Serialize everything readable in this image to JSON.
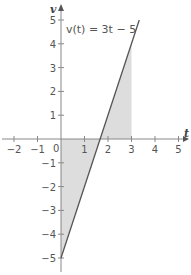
{
  "chart_data": {
    "type": "line",
    "title": "",
    "xlabel": "t",
    "ylabel": "v",
    "xlim": [
      -2.5,
      5.5
    ],
    "ylim": [
      -5.5,
      5.5
    ],
    "x_ticks": [
      -2,
      -1,
      1,
      2,
      3,
      4,
      5
    ],
    "x_tick_labels": [
      "−2",
      "−1",
      "1",
      "2",
      "3",
      "4",
      "5"
    ],
    "y_ticks": [
      5,
      4,
      3,
      2,
      1,
      -1,
      -2,
      -3,
      -4,
      -5
    ],
    "y_tick_labels": [
      "5",
      "4",
      "3",
      "2",
      "1",
      "−1",
      "−2",
      "−3",
      "−4",
      "−5"
    ],
    "origin_label": "0",
    "grid": false,
    "series": [
      {
        "name": "v(t) = 3t − 5",
        "function": "3t - 5",
        "x": [
          0,
          3.33
        ],
        "y": [
          -5,
          5
        ]
      }
    ],
    "shaded_region": {
      "between": "v(t) and t-axis",
      "t_range": [
        0,
        3
      ],
      "color": "#dddddd"
    },
    "annotations": [
      {
        "text": "v(t) = 3t − 5",
        "x": 0.5,
        "y": 4.6
      }
    ],
    "colors": {
      "line": "#555555",
      "axis": "#888888",
      "fill": "#dddddd"
    }
  }
}
